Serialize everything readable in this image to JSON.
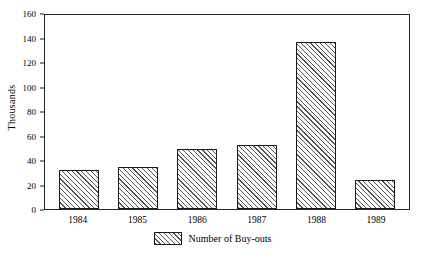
{
  "chart_data": {
    "type": "bar",
    "title": "",
    "subtitle": "",
    "xlabel": "",
    "ylabel": "Thousands",
    "categories": [
      "1984",
      "1985",
      "1986",
      "1987",
      "1988",
      "1989"
    ],
    "values": [
      32,
      34,
      49,
      52,
      136,
      24
    ],
    "series": [
      {
        "name": "Number of Buy-outs",
        "values": [
          32,
          34,
          49,
          52,
          136,
          24
        ]
      }
    ],
    "ylim": [
      0,
      160
    ],
    "ytick_values": [
      0,
      20,
      40,
      60,
      80,
      100,
      120,
      140,
      160
    ],
    "ytick_labels": [
      "0",
      "20",
      "40",
      "60",
      "80",
      "100",
      "120",
      "140",
      "160"
    ],
    "grid": false,
    "legend_position": "bottom-center",
    "legend_entries": [
      "Number of Buy-outs"
    ],
    "bar_fill": "diagonal-hatch",
    "bar_edge_color": "#1a1a1a",
    "hatch_color": "#555555",
    "frame": true,
    "background": "#ffffff"
  },
  "legend": {
    "swatch_name": "hatched-square-swatch",
    "label": "Number of Buy-outs"
  }
}
